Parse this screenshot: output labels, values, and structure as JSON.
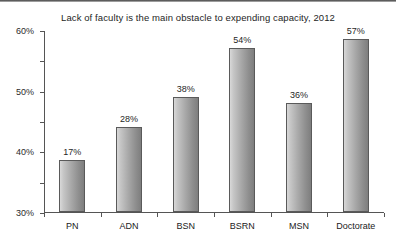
{
  "chart_data": {
    "type": "bar",
    "title": "Lack of faculty is the main obstacle to expending capacity, 2012",
    "xlabel": "",
    "ylabel": "",
    "categories": [
      "PN",
      "ADN",
      "BSN",
      "BSRN",
      "MSN",
      "Doctorate"
    ],
    "values": [
      17,
      28,
      38,
      54,
      36,
      57
    ],
    "value_labels": [
      "17%",
      "28%",
      "38%",
      "54%",
      "36%",
      "57%"
    ],
    "ylim": [
      0,
      60
    ],
    "ytick_values": [
      0,
      10,
      20,
      30,
      40,
      50,
      60
    ],
    "ytick_labels": [
      "0%",
      "10%",
      "20%",
      "30%",
      "40%",
      "50%",
      "60%"
    ],
    "grid": false,
    "legend": false,
    "series": [
      {
        "name": "Lack of faculty",
        "values": [
          17,
          28,
          38,
          54,
          36,
          57
        ]
      }
    ],
    "colors": {
      "bar_light": "#d8d8d8",
      "bar_dark": "#7e7e7e",
      "bar_border": "#5a5a5a",
      "axis": "#555555",
      "text": "#222222",
      "background": "#ffffff"
    }
  }
}
